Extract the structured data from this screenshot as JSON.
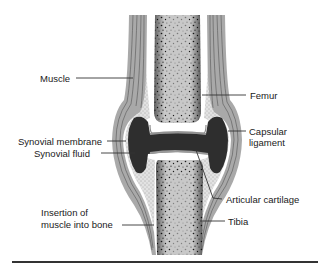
{
  "diagram": {
    "colors": {
      "bone_fill": "#c8c8c8",
      "bone_speckle": "#1a1a1a",
      "muscle_fill": "#a9a9a9",
      "muscle_lines": "#555555",
      "synovial_fluid": "#2e2e2e",
      "cartilage": "#8a8a8a",
      "capsule_dotted": "#d4d4d4",
      "leader_line": "#333333",
      "text": "#1a1a1a"
    },
    "labels": {
      "muscle": "Muscle",
      "femur": "Femur",
      "capsular_line1": "Capsular",
      "capsular_line2": "ligament",
      "synovial_membrane": "Synovial membrane",
      "synovial_fluid": "Synovial fluid",
      "articular_cartilage": "Articular cartilage",
      "insertion_line1": "Insertion of",
      "insertion_line2": "muscle into bone",
      "tibia": "Tibia"
    }
  }
}
